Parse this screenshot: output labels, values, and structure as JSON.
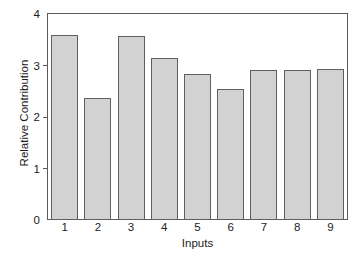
{
  "chart_data": {
    "type": "bar",
    "title": "",
    "subtitle": "",
    "xlabel": "Inputs",
    "ylabel": "Relative Contribution",
    "categories": [
      "1",
      "2",
      "3",
      "4",
      "5",
      "6",
      "7",
      "8",
      "9"
    ],
    "values": [
      3.59,
      2.37,
      3.57,
      3.14,
      2.83,
      2.54,
      2.91,
      2.92,
      2.94
    ],
    "series": [
      {
        "name": "Relative Contribution",
        "values": [
          3.59,
          2.37,
          3.57,
          3.14,
          2.83,
          2.54,
          2.91,
          2.92,
          2.94
        ]
      }
    ],
    "ylim": [
      0,
      4
    ],
    "yticks": [
      0,
      1,
      2,
      3,
      4
    ],
    "ytick_labels": [
      "0",
      "1",
      "2",
      "3",
      "4"
    ],
    "xtick_labels": [
      "1",
      "2",
      "3",
      "4",
      "5",
      "6",
      "7",
      "8",
      "9"
    ],
    "grid": false,
    "legend": null,
    "legend_position": "none",
    "bar_fill_color": "#d2d2d2",
    "bar_edge_color": "#5f5f5f",
    "axis_color": "#5a5a5a",
    "text_color": "#1c1c1c",
    "background_color": "#ffffff"
  }
}
